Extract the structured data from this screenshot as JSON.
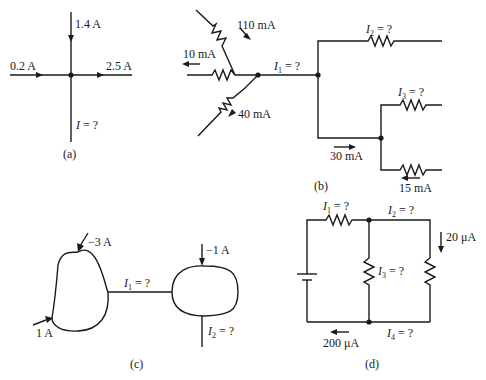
{
  "figure": {
    "panels": [
      {
        "id": "a",
        "caption": "(a)",
        "labels": {
          "top": "1.4 A",
          "left": "0.2 A",
          "right": "2.5 A",
          "bottom_var": "I",
          "bottom_eq": " = ?"
        }
      },
      {
        "id": "b",
        "caption": "(b)",
        "labels": {
          "upper_in": "110 mA",
          "left_out": "10 mA",
          "lower_in": "40 mA",
          "i1_var": "I",
          "i1_sub": "1",
          "i1_eq": " = ?",
          "i2_var": "I",
          "i2_sub": "2",
          "i2_eq": " = ?",
          "i3_var": "I",
          "i3_sub": "3",
          "i3_eq": " = ?",
          "mid_current": "30 mA",
          "bottom_current": "15 mA"
        }
      },
      {
        "id": "c",
        "caption": "(c)",
        "labels": {
          "top_left": "−3 A",
          "bottom_left": "1 A",
          "top_right": "−1 A",
          "i1_var": "I",
          "i1_sub": "1",
          "i1_eq": " = ?",
          "i2_var": "I",
          "i2_sub": "2",
          "i2_eq": " = ?"
        }
      },
      {
        "id": "d",
        "caption": "(d)",
        "labels": {
          "i1_var": "I",
          "i1_sub": "1",
          "i1_eq": " = ?",
          "i2_var": "I",
          "i2_sub": "2",
          "i2_eq": " = ?",
          "i3_var": "I",
          "i3_sub": "3",
          "i3_eq": " = ?",
          "i4_var": "I",
          "i4_sub": "4",
          "i4_eq": " = ?",
          "right_current": "20 μA",
          "bottom_current": "200 μA"
        }
      }
    ]
  }
}
